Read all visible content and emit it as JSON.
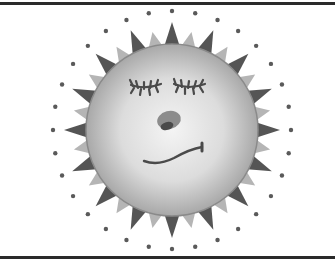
{
  "image": {
    "subject": "Cartoon sun with sleepy face",
    "alt_text": "Clipart sun with closed eyelashed eyes, a small nose and a wavy smirk, surrounded by alternating dark and light triangular rays tipped with dots"
  },
  "colors": {
    "background": "#ffffff",
    "frame": "#2a2a2a",
    "face_light": "#f2f2f2",
    "face_mid": "#c8c8c8",
    "face_edge": "#9a9a9a",
    "ray_dark": "#555555",
    "ray_light": "#b5b5b5",
    "dot": "#5a5a5a",
    "features": "#4a4a4a",
    "nose_light": "#8a8a8a",
    "nose_dark": "#4a4a4a"
  },
  "sun": {
    "center_x": 172,
    "center_y": 130,
    "face_radius": 86,
    "ray_count": 32,
    "ray_outer_radius": 108,
    "dot_radius_distance": 119
  }
}
